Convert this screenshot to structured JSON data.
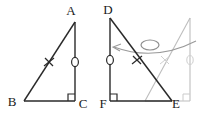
{
  "figure": {
    "colors": {
      "solid_stroke": "#2a2a2a",
      "ghost_stroke": "#bdbdbd",
      "arc_stroke": "#8a8a8a",
      "background": "#ffffff"
    },
    "labels": {
      "A": "A",
      "B": "B",
      "C": "C",
      "D": "D",
      "E": "E",
      "F": "F"
    },
    "left_triangle": {
      "name": "triangle-ABC",
      "vertices": {
        "A": [
          75,
          22
        ],
        "B": [
          24,
          101
        ],
        "C": [
          75,
          101
        ]
      },
      "right_angle_at": "C",
      "marks": [
        {
          "type": "x-tick",
          "on": "AB",
          "at": [
            49,
            62
          ]
        },
        {
          "type": "circle-tick",
          "on": "AC",
          "at": [
            75,
            62
          ]
        }
      ]
    },
    "right_triangle": {
      "name": "triangle-DFE",
      "vertices": {
        "D": [
          110,
          18
        ],
        "F": [
          110,
          101
        ],
        "E": [
          172,
          101
        ]
      },
      "right_angle_at": "F",
      "marks": [
        {
          "type": "circle-tick",
          "on": "DF",
          "at": [
            110,
            60
          ]
        },
        {
          "type": "x-tick",
          "on": "DE",
          "at": [
            137,
            60
          ]
        }
      ]
    },
    "ghost_triangle": {
      "name": "ghost-triangle-image",
      "vertices": {
        "top": [
          190,
          18
        ],
        "bottom_right": [
          190,
          101
        ],
        "bottom_left": [
          145,
          101
        ]
      },
      "right_angle_at": "bottom_right",
      "marks": [
        {
          "type": "circle-tick",
          "on": "vertical",
          "at": [
            190,
            60
          ]
        },
        {
          "type": "x-tick",
          "on": "hypotenuse",
          "at": [
            165,
            60
          ]
        }
      ]
    },
    "rotation_arc": {
      "name": "rotation-arrow",
      "direction": "counterclockwise-left",
      "arrow_tip": [
        113,
        47
      ],
      "ellipse_marker": {
        "cx": 150,
        "cy": 45,
        "rx": 9,
        "ry": 5
      }
    }
  }
}
